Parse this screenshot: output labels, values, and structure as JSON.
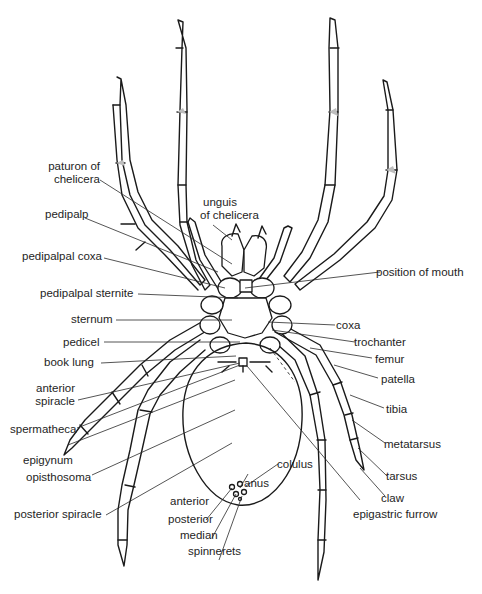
{
  "figure": {
    "labels_left": {
      "paturon": [
        "paturon of",
        "chelicera"
      ],
      "pedipalp": "pedipalp",
      "pedipalpal_coxa": "pedipalpal coxa",
      "pedipalpal_sternite": "pedipalpal sternite",
      "sternum": "sternum",
      "pedicel": "pedicel",
      "book_lung": "book lung",
      "anterior_spiracle": [
        "anterior",
        "spiracle"
      ],
      "spermatheca": "spermatheca",
      "epigynum": "epigynum",
      "opisthosoma": "opisthosoma",
      "posterior_spiracle": "posterior spiracle"
    },
    "labels_center": {
      "unguis": [
        "unguis",
        "of chelicera"
      ],
      "anterior": "anterior",
      "posterior": "posterior",
      "median": "median",
      "spinnerets": "spinnerets",
      "anus": "anus",
      "colulus": "colulus"
    },
    "labels_right": {
      "position_of_mouth": "position of mouth",
      "coxa": "coxa",
      "trochanter": "trochanter",
      "femur": "femur",
      "patella": "patella",
      "tibia": "tibia",
      "metatarsus": "metatarsus",
      "tarsus": "tarsus",
      "claw": "claw",
      "epigastric_furrow": "epigastric furrow"
    }
  }
}
